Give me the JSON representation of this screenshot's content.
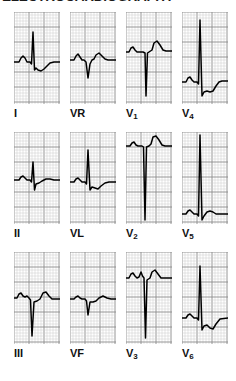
{
  "figure": {
    "title": "ELECTROCARDIOGRAPHY",
    "type": "12-lead-ecg",
    "paper": {
      "fine_grid_color": "#c9c9c9",
      "bold_grid_color": "#8a8a8a",
      "background_color": "#ffffff",
      "trace_color": "#000000",
      "fine_grid_spacing_px": 3,
      "bold_grid_every": 5
    },
    "layout": {
      "columns": 4,
      "rows": 3,
      "panel_width_px": 46,
      "panel_height_px": 92
    }
  },
  "leads": [
    {
      "id": "I",
      "label": "I",
      "sub": "",
      "row": 0,
      "col": 0,
      "baseline_pct": 55,
      "description": "Small P wave, tall narrow R wave, small S wave, flat to slightly inverted T wave",
      "trace": "M0,50 L5,50 L7,46 L9,44 L11,46 L13,50 L16,50 L17.5,52 L19,20 L20.5,58 L22,56 L24,58 L27,59 L30,57 L33,54 L36,51 L40,50 L46,50"
    },
    {
      "id": "VR",
      "label": "VR",
      "sub": "",
      "row": 0,
      "col": 1,
      "baseline_pct": 52,
      "description": "Negative QS complexes typical of aVR, downward deflections",
      "trace": "M0,48 L4,48 L6,44 L8,42 L10,45 L12,48 L14,48 L16,50 L18,66 L20,52 L22,48 L24,47 L26,43 L29,41 L32,44 L35,47 L38,48 L46,48"
    },
    {
      "id": "V1",
      "label": "V",
      "sub": "1",
      "row": 0,
      "col": 2,
      "baseline_pct": 42,
      "description": "Small r wave then deep narrow S wave descending to lower panel, upright T wave",
      "trace": "M0,40 L3,40 L5,36 L7,35 L9,38 L11,40 L17,40 L19,41 L20,84 L21.5,41 L23,40 L26,38 L28,31 L31,29 L34,33 L37,38 L40,39 L46,39"
    },
    {
      "id": "V4",
      "label": "V",
      "sub": "4",
      "row": 0,
      "col": 3,
      "baseline_pct": 72,
      "description": "Very tall R wave spanning most of panel height, deep S wave, inverted T wave",
      "trace": "M0,70 L4,70 L6,66 L8,65 L10,68 L12,70 L15,70 L16.5,72 L18,8 L20,84 L22,80 L25,79 L28,80 L31,79 L34,74 L37,70 L40,69 L46,69"
    },
    {
      "id": "II",
      "label": "II",
      "sub": "",
      "row": 1,
      "col": 0,
      "baseline_pct": 52,
      "description": "Small P wave, modest R wave, small S wave, nearly flat T wave",
      "trace": "M0,48 L5,48 L7,45 L9,44 L11,46 L13,48 L16,48 L17.5,50 L19,30 L20.5,58 L22,52 L25,51 L28,49 L32,47 L36,47 L40,48 L46,48"
    },
    {
      "id": "VL",
      "label": "VL",
      "sub": "",
      "row": 1,
      "col": 1,
      "baseline_pct": 55,
      "description": "Tall R wave similar to lead I, small S, shallow inverted T wave",
      "trace": "M0,50 L4,50 L6,47 L8,46 L10,48 L12,50 L15,50 L16.5,52 L18,18 L20,58 L22,55 L25,56 L28,57 L31,54 L35,51 L39,50 L46,50"
    },
    {
      "id": "V2",
      "label": "V",
      "sub": "2",
      "row": 1,
      "col": 2,
      "baseline_pct": 18,
      "description": "High baseline with very deep S wave extending nearly to bottom of panel, tall T wave",
      "trace": "M0,14 L4,14 L6,11 L8,10 L10,13 L12,14 L16,14 L17.5,15 L19,88 L20.5,15 L23,14 L25,12 L27,5 L30,4 L33,8 L36,13 L39,14 L46,14"
    },
    {
      "id": "V5",
      "label": "V",
      "sub": "5",
      "row": 1,
      "col": 3,
      "baseline_pct": 85,
      "description": "Extremely tall R wave spanning full panel height from low baseline, small T wave",
      "trace": "M0,82 L4,82 L6,79 L8,78 L10,80 L12,82 L15,82 L16.5,84 L18,3 L20,88 L22,84 L25,80 L28,79 L31,80 L34,82 L38,82 L46,82"
    },
    {
      "id": "III",
      "label": "III",
      "sub": "",
      "row": 2,
      "col": 0,
      "baseline_pct": 50,
      "description": "Deep narrow Q/S wave below baseline, biphasic T wave",
      "trace": "M0,46 L3,46 L5,42 L7,41 L9,44 L11,45 L13,44 L15,46 L16.5,48 L18,84 L20,50 L23,49 L26,47 L29,41 L32,40 L35,44 L38,47 L46,47"
    },
    {
      "id": "VF",
      "label": "VF",
      "sub": "",
      "row": 2,
      "col": 1,
      "baseline_pct": 50,
      "description": "Small downward deflection, relatively flat complexes with low amplitude",
      "trace": "M0,47 L4,47 L6,45 L8,44 L10,46 L12,47 L15,47 L16.5,49 L18,63 L20,50 L23,50 L26,49 L29,46 L33,44 L37,46 L41,47 L46,47"
    },
    {
      "id": "V3",
      "label": "V",
      "sub": "3",
      "row": 2,
      "col": 2,
      "baseline_pct": 30,
      "description": "High baseline with deep S wave reaching low panel, prominent T wave",
      "trace": "M0,26 L3,26 L5,22 L7,21 L9,24 L11,26 L13,25 L15,20 L16.5,24 L18,26 L19.5,86 L21,28 L24,26 L26,20 L29,18 L32,22 L35,26 L38,26 L46,26"
    },
    {
      "id": "V6",
      "label": "V",
      "sub": "6",
      "row": 2,
      "col": 3,
      "baseline_pct": 68,
      "description": "Tall R wave with inverted T wave following",
      "trace": "M0,66 L4,66 L6,63 L8,62 L10,64 L12,66 L15,66 L16.5,68 L18,14 L20,78 L22,74 L25,73 L28,76 L31,77 L34,72 L38,67 L46,66"
    }
  ]
}
